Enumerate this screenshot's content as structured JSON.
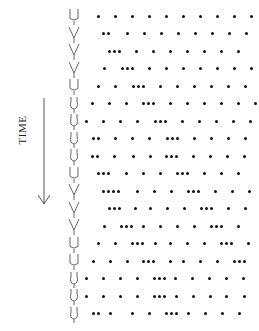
{
  "figure": {
    "axis_label": "TIME",
    "arrow_direction": "down",
    "row_start_y": 16,
    "row_spacing": 17.5,
    "glyphs": [
      "U",
      "V",
      "V",
      "V",
      "U",
      "O",
      "O",
      "O",
      "O",
      "U",
      "V",
      "V",
      "V",
      "U",
      "U",
      "O",
      "O",
      "O"
    ],
    "rows": [
      [
        98,
        115,
        132,
        149,
        166,
        183,
        200,
        217,
        234,
        251,
        268,
        285,
        302,
        319
      ],
      [
        103,
        108,
        127,
        144,
        161,
        178,
        195,
        212,
        229,
        246
      ],
      [
        109,
        114,
        119,
        136,
        153,
        170,
        187,
        204,
        221,
        238
      ],
      [
        104,
        122,
        127,
        132,
        149,
        166,
        183,
        200,
        217,
        234,
        251
      ],
      [
        98,
        115,
        133,
        138,
        143,
        160,
        177,
        194,
        211,
        228,
        245
      ],
      [
        92,
        109,
        126,
        143,
        148,
        153,
        170,
        187,
        204,
        221,
        238,
        255
      ],
      [
        86,
        103,
        120,
        137,
        155,
        160,
        165,
        182,
        199,
        216,
        233,
        250
      ],
      [
        93,
        98,
        115,
        132,
        149,
        167,
        172,
        177,
        194,
        211,
        228,
        245
      ],
      [
        92,
        97,
        114,
        133,
        150,
        166,
        171,
        176,
        193,
        210,
        227,
        244
      ],
      [
        98,
        103,
        108,
        126,
        143,
        160,
        177,
        182,
        187,
        204,
        221,
        238
      ],
      [
        103,
        108,
        113,
        118,
        137,
        154,
        171,
        188,
        193,
        198,
        215,
        232,
        249
      ],
      [
        109,
        114,
        119,
        135,
        150,
        167,
        184,
        201,
        206,
        211,
        228,
        245
      ],
      [
        104,
        121,
        126,
        131,
        143,
        160,
        177,
        194,
        211,
        216,
        221,
        238
      ],
      [
        98,
        115,
        132,
        137,
        142,
        155,
        170,
        187,
        204,
        221,
        226,
        231,
        248
      ],
      [
        93,
        110,
        127,
        143,
        148,
        153,
        170,
        183,
        200,
        217,
        234,
        239,
        244
      ],
      [
        86,
        103,
        120,
        137,
        154,
        159,
        164,
        175,
        192,
        209,
        226,
        243
      ],
      [
        86,
        103,
        120,
        137,
        154,
        159,
        164,
        176,
        193,
        210,
        226,
        244
      ],
      [
        93,
        98,
        110,
        132,
        149,
        166,
        171,
        176,
        188,
        205,
        222,
        239
      ]
    ]
  }
}
